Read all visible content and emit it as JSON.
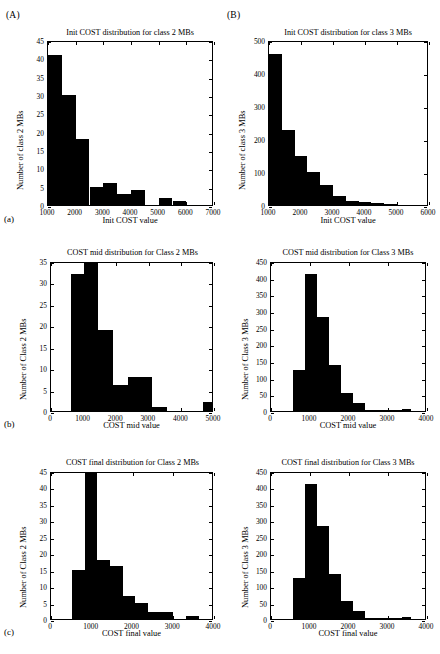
{
  "figure": {
    "panel_tags": [
      "(A)",
      "(B)"
    ],
    "subcaptions": [
      "(a)",
      "(b)",
      "(c)"
    ]
  },
  "chart_data": [
    {
      "id": "init-class2",
      "type": "bar",
      "panel_tag": "(A)",
      "subcaption": "(a)",
      "title": "Init COST distribution for class 2 MBs",
      "xlabel": "Init COST value",
      "ylabel": "Number of class 2 MBs",
      "xlim": [
        1000,
        7000
      ],
      "ylim": [
        0,
        45
      ],
      "xticks": [
        1000,
        2000,
        3000,
        4000,
        5000,
        6000,
        7000
      ],
      "xticklabels": [
        "1000",
        "2000",
        "3000",
        "4000",
        "5000",
        "6000",
        "7000"
      ],
      "yticks": [
        0,
        5,
        10,
        15,
        20,
        25,
        30,
        35,
        40,
        45
      ],
      "yticklabels": [
        "0",
        "5",
        "10",
        "15",
        "20",
        "25",
        "30",
        "35",
        "40",
        "45"
      ],
      "grid": false,
      "bin_edges": [
        1000,
        1500,
        2000,
        2500,
        3000,
        3500,
        4000,
        4500,
        5000,
        5500,
        6000,
        6500
      ],
      "values": [
        41,
        30,
        18,
        5,
        6,
        3,
        4,
        0,
        2,
        1,
        0
      ]
    },
    {
      "id": "init-class3",
      "type": "bar",
      "panel_tag": "(B)",
      "subcaption": "(a)",
      "title": "Init COST distribution for class 3 MBs",
      "xlabel": "Init COST value",
      "ylabel": "Number of class 3 MBs",
      "xlim": [
        1000,
        6000
      ],
      "ylim": [
        0,
        500
      ],
      "xticks": [
        1000,
        2000,
        3000,
        4000,
        5000,
        6000
      ],
      "xticklabels": [
        "1000",
        "2000",
        "3000",
        "4000",
        "5000",
        "6000"
      ],
      "yticks": [
        0,
        100,
        200,
        300,
        400,
        500
      ],
      "yticklabels": [
        "0",
        "100",
        "200",
        "300",
        "400",
        "500"
      ],
      "grid": false,
      "bin_edges": [
        1000,
        1400,
        1800,
        2200,
        2600,
        3000,
        3400,
        3800,
        4200,
        4600,
        5000,
        5400
      ],
      "values": [
        458,
        228,
        148,
        100,
        60,
        28,
        12,
        8,
        5,
        3,
        0
      ]
    },
    {
      "id": "mid-class2",
      "type": "bar",
      "panel_tag": "",
      "subcaption": "(b)",
      "title": "COST mid distribution for Class 2 MBs",
      "xlabel": "COST mid value",
      "ylabel": "Number of Class 2 MBs",
      "xlim": [
        0,
        5000
      ],
      "ylim": [
        0,
        35
      ],
      "xticks": [
        0,
        1000,
        2000,
        3000,
        4000,
        5000
      ],
      "xticklabels": [
        "0",
        "1000",
        "2000",
        "3000",
        "4000",
        "5000"
      ],
      "yticks": [
        0,
        5,
        10,
        15,
        20,
        25,
        30,
        35
      ],
      "yticklabels": [
        "0",
        "5",
        "10",
        "15",
        "20",
        "25",
        "30",
        "35"
      ],
      "grid": false,
      "bin_edges": [
        600,
        1000,
        1450,
        1900,
        2350,
        3100,
        3550,
        4650,
        5000
      ],
      "values": [
        32,
        35,
        19,
        6,
        8,
        1,
        0,
        2
      ],
      "note": "final bin near 4650-5000 has height 2"
    },
    {
      "id": "mid-class3",
      "type": "bar",
      "panel_tag": "",
      "subcaption": "(b)",
      "title": "COST mid distribution for Class 3 MBs",
      "xlabel": "COST mid value",
      "ylabel": "Number of Class 3 MBs",
      "xlim": [
        0,
        4000
      ],
      "ylim": [
        0,
        450
      ],
      "xticks": [
        0,
        1000,
        2000,
        3000,
        4000
      ],
      "xticklabels": [
        "0",
        "1000",
        "2000",
        "3000",
        "4000"
      ],
      "yticks": [
        0,
        50,
        100,
        150,
        200,
        250,
        300,
        350,
        400,
        450
      ],
      "yticklabels": [
        "0",
        "50",
        "100",
        "150",
        "200",
        "250",
        "300",
        "350",
        "400",
        "450"
      ],
      "grid": false,
      "bin_edges": [
        560,
        870,
        1180,
        1490,
        1800,
        2110,
        2420,
        3350,
        3600
      ],
      "values": [
        124,
        411,
        281,
        138,
        55,
        24,
        2,
        6
      ]
    },
    {
      "id": "final-class2",
      "type": "bar",
      "panel_tag": "",
      "subcaption": "(c)",
      "title": "COST final distribution for Class 2 MBs",
      "xlabel": "COST final value",
      "ylabel": "Number of Class 2 MBs",
      "xlim": [
        0,
        4000
      ],
      "ylim": [
        0,
        45
      ],
      "xticks": [
        0,
        1000,
        2000,
        3000,
        4000
      ],
      "xticklabels": [
        "0",
        "1000",
        "2000",
        "3000",
        "4000"
      ],
      "yticks": [
        0,
        5,
        10,
        15,
        20,
        25,
        30,
        35,
        40,
        45
      ],
      "yticklabels": [
        "0",
        "5",
        "10",
        "15",
        "20",
        "25",
        "30",
        "35",
        "40",
        "45"
      ],
      "grid": false,
      "bin_edges": [
        520,
        830,
        1140,
        1450,
        1760,
        2070,
        2380,
        2690,
        3000,
        3320,
        3630
      ],
      "values": [
        15,
        45,
        18,
        16,
        7,
        5,
        2,
        2,
        0,
        1
      ],
      "note": "tall spike of 45 at the 830-1140 bin"
    },
    {
      "id": "final-class3",
      "type": "bar",
      "panel_tag": "",
      "subcaption": "(c)",
      "title": "COST final distribution for Class 3 MBs",
      "xlabel": "COST final value",
      "ylabel": "Number of Class 3 MBs",
      "xlim": [
        0,
        4000
      ],
      "ylim": [
        0,
        450
      ],
      "xticks": [
        0,
        1000,
        2000,
        3000,
        4000
      ],
      "xticklabels": [
        "0",
        "1000",
        "2000",
        "3000",
        "4000"
      ],
      "yticks": [
        0,
        50,
        100,
        150,
        200,
        250,
        300,
        350,
        400,
        450
      ],
      "yticklabels": [
        "0",
        "50",
        "100",
        "150",
        "200",
        "250",
        "300",
        "350",
        "400",
        "450"
      ],
      "grid": false,
      "bin_edges": [
        560,
        870,
        1180,
        1490,
        1800,
        2110,
        2420,
        3350,
        3600
      ],
      "values": [
        124,
        411,
        284,
        138,
        55,
        24,
        2,
        6
      ]
    }
  ]
}
